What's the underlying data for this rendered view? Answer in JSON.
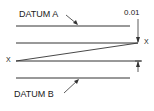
{
  "diagram": {
    "labels": {
      "datum_a": "DATUM A",
      "datum_b": "DATUM B",
      "tolerance": "0.01",
      "point_left": "X",
      "point_right": "X"
    },
    "colors": {
      "line": "#333333",
      "text": "#222222",
      "background": "#ffffff"
    }
  }
}
